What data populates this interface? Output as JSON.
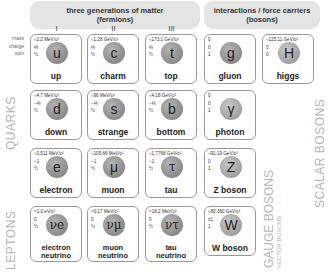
{
  "headers": {
    "fermions": [
      "three generations of matter",
      "(fermions)"
    ],
    "bosons": [
      "interactions / force carriers",
      "(bosons)"
    ],
    "generations": [
      "I",
      "II",
      "III"
    ]
  },
  "row_labels": {
    "mass": "mass",
    "charge": "charge",
    "spin": "spin"
  },
  "side_labels": {
    "quarks": "QUARKS",
    "leptons": "LEPTONS",
    "gauge_bosons": "GAUGE BOSONS",
    "vector_bosons": "VECTOR BOSONS",
    "scalar_bosons": "SCALAR BOSONS"
  },
  "particles": {
    "up": {
      "mass": "≈2.2 MeV/c²",
      "charge": "⅔",
      "spin": "½",
      "symbol": "u",
      "name": "up"
    },
    "charm": {
      "mass": "≈1.28 GeV/c²",
      "charge": "⅔",
      "spin": "½",
      "symbol": "c",
      "name": "charm"
    },
    "top": {
      "mass": "≈173.1 GeV/c²",
      "charge": "⅔",
      "spin": "½",
      "symbol": "t",
      "name": "top"
    },
    "gluon": {
      "mass": "0",
      "charge": "0",
      "spin": "1",
      "symbol": "g",
      "name": "gluon"
    },
    "higgs": {
      "mass": "≈125.11 GeV/c²",
      "charge": "0",
      "spin": "0",
      "symbol": "H",
      "name": "higgs"
    },
    "down": {
      "mass": "≈4.7 MeV/c²",
      "charge": "−⅓",
      "spin": "½",
      "symbol": "d",
      "name": "down"
    },
    "strange": {
      "mass": "≈96 MeV/c²",
      "charge": "−⅓",
      "spin": "½",
      "symbol": "s",
      "name": "strange"
    },
    "bottom": {
      "mass": "≈4.18 GeV/c²",
      "charge": "−⅓",
      "spin": "½",
      "symbol": "b",
      "name": "bottom"
    },
    "photon": {
      "mass": "0",
      "charge": "0",
      "spin": "1",
      "symbol": "γ",
      "name": "photon"
    },
    "electron": {
      "mass": "≈0.511 MeV/c²",
      "charge": "−1",
      "spin": "½",
      "symbol": "e",
      "name": "electron"
    },
    "muon": {
      "mass": "≈105.66 MeV/c²",
      "charge": "−1",
      "spin": "½",
      "symbol": "μ",
      "name": "muon"
    },
    "tau": {
      "mass": "≈1.7768 GeV/c²",
      "charge": "−1",
      "spin": "½",
      "symbol": "τ",
      "name": "tau"
    },
    "zboson": {
      "mass": "≈91.19 GeV/c²",
      "charge": "0",
      "spin": "1",
      "symbol": "Z",
      "name": "Z boson"
    },
    "nue": {
      "mass": "<1.0 eV/c²",
      "charge": "0",
      "spin": "½",
      "symbol": "νe",
      "name1": "electron",
      "name2": "neutrino"
    },
    "numu": {
      "mass": "<0.17 MeV/c²",
      "charge": "0",
      "spin": "½",
      "symbol": "νμ",
      "name1": "muon",
      "name2": "neutrino"
    },
    "nutau": {
      "mass": "<18.2 MeV/c²",
      "charge": "0",
      "spin": "½",
      "symbol": "ντ",
      "name1": "tau",
      "name2": "neutrino"
    },
    "wboson": {
      "mass": "≈80.360 GeV/c²",
      "charge": "±1",
      "spin": "1",
      "symbol": "W",
      "name": "W boson"
    }
  }
}
